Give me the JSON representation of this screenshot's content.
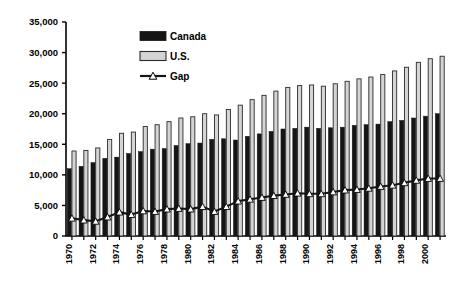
{
  "chart_data": {
    "type": "bar",
    "title": "",
    "subtitle": "",
    "xlabel": "",
    "ylabel": "",
    "ylim": [
      0,
      35000
    ],
    "ytick_values": [
      0,
      5000,
      10000,
      15000,
      20000,
      25000,
      30000,
      35000
    ],
    "ytick_labels": [
      "0",
      "5,000",
      "10,000",
      "15,000",
      "20,000",
      "25,000",
      "30,000",
      "35,000"
    ],
    "grid": false,
    "legend_position": "top-center",
    "categories": [
      "1970",
      "1971",
      "1972",
      "1973",
      "1974",
      "1975",
      "1976",
      "1977",
      "1978",
      "1979",
      "1980",
      "1981",
      "1982",
      "1983",
      "1984",
      "1985",
      "1986",
      "1987",
      "1988",
      "1989",
      "1990",
      "1991",
      "1992",
      "1993",
      "1994",
      "1995",
      "1996",
      "1997",
      "1998",
      "1999",
      "2000",
      "2001"
    ],
    "xtick_labels": [
      "1970",
      "",
      "1972",
      "",
      "1974",
      "",
      "1976",
      "",
      "1978",
      "",
      "1980",
      "",
      "1982",
      "",
      "1984",
      "",
      "1986",
      "",
      "1988",
      "",
      "1990",
      "",
      "1992",
      "",
      "1994",
      "",
      "1996",
      "",
      "1998",
      "",
      "2000",
      ""
    ],
    "series": [
      {
        "name": "Canada",
        "type": "bar",
        "color": "#151515",
        "values": [
          11000,
          11400,
          12000,
          12700,
          12900,
          13500,
          13800,
          14200,
          14300,
          14800,
          15100,
          15200,
          15800,
          15900,
          15700,
          16300,
          16700,
          17100,
          17500,
          17600,
          17800,
          17600,
          17700,
          17800,
          18100,
          18200,
          18300,
          18700,
          18900,
          19300,
          19600,
          20000
        ]
      },
      {
        "name": "U.S.",
        "type": "bar",
        "color": "#d4d4d4",
        "values": [
          13900,
          14000,
          14400,
          15800,
          16800,
          17000,
          17900,
          18200,
          18700,
          19300,
          19500,
          20000,
          19800,
          20700,
          21400,
          22300,
          23000,
          23700,
          24300,
          24600,
          24700,
          24500,
          24900,
          25300,
          25700,
          26000,
          26400,
          27000,
          27600,
          28400,
          29000,
          29400
        ]
      },
      {
        "name": "Gap",
        "type": "line",
        "color": "#151515",
        "marker": "triangle-up",
        "marker_fill": "#ffffff",
        "values": [
          2900,
          2600,
          2400,
          3100,
          3900,
          3500,
          4100,
          4000,
          4400,
          4500,
          4400,
          4800,
          4000,
          4800,
          5700,
          6000,
          6300,
          6600,
          6800,
          7000,
          6900,
          6900,
          7200,
          7500,
          7600,
          7800,
          8100,
          8300,
          8700,
          9100,
          9400,
          9400
        ]
      }
    ],
    "legend": [
      {
        "label": "Canada",
        "swatch": "solid-black-bar"
      },
      {
        "label": "U.S.",
        "swatch": "light-gray-bar"
      },
      {
        "label": "Gap",
        "swatch": "line-with-triangle-marker"
      }
    ]
  }
}
